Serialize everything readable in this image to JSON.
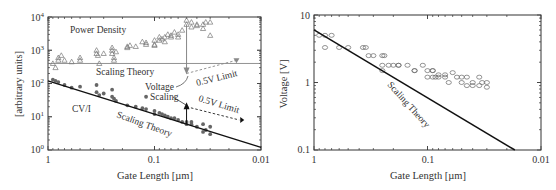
{
  "chart_data": [
    {
      "type": "scatter",
      "title": "",
      "xlabel": "Gate Length [µm]",
      "ylabel": "[arbitrary units]",
      "xscale": "log",
      "yscale": "log",
      "xlim": [
        1,
        0.01
      ],
      "ylim": [
        1,
        10000
      ],
      "x_tick_labels": [
        "1",
        "0.1",
        "0.01"
      ],
      "y_tick_labels": [
        {
          "base": "10",
          "exp": "0"
        },
        {
          "base": "10",
          "exp": "1"
        },
        {
          "base": "10",
          "exp": "2"
        },
        {
          "base": "10",
          "exp": "3"
        },
        {
          "base": "10",
          "exp": "4"
        }
      ],
      "grid": false,
      "annotations": {
        "power_density": "Power Density",
        "scaling_theory_upper": "Scaling Theory",
        "limit_upper": "0.5V Limit",
        "voltage_scaling_1": "Voltage",
        "voltage_scaling_2": "Scaling",
        "limit_lower": "0.5V Limit",
        "cvi": "CV/I",
        "scaling_theory_lower": "Scaling Theory"
      },
      "series": [
        {
          "name": "Power Density",
          "marker": "open-triangle",
          "x": [
            0.9,
            0.85,
            0.8,
            0.8,
            0.75,
            0.7,
            0.6,
            0.5,
            0.5,
            0.35,
            0.35,
            0.34,
            0.33,
            0.3,
            0.25,
            0.25,
            0.25,
            0.24,
            0.24,
            0.23,
            0.18,
            0.18,
            0.17,
            0.15,
            0.13,
            0.12,
            0.12,
            0.1,
            0.1,
            0.1,
            0.09,
            0.09,
            0.085,
            0.08,
            0.08,
            0.075,
            0.07,
            0.07,
            0.065,
            0.06,
            0.06,
            0.055,
            0.05,
            0.05,
            0.045,
            0.045,
            0.04,
            0.04,
            0.035,
            0.035,
            0.033,
            0.03,
            0.03
          ],
          "y": [
            400,
            300,
            600,
            500,
            700,
            500,
            450,
            600,
            500,
            1000,
            800,
            700,
            400,
            800,
            1200,
            1000,
            800,
            600,
            500,
            900,
            1300,
            1200,
            1400,
            1300,
            1800,
            1700,
            1500,
            2000,
            1500,
            1400,
            2500,
            2000,
            2200,
            2500,
            1800,
            3000,
            2800,
            2500,
            3500,
            3000,
            2500,
            4000,
            8000,
            6000,
            5000,
            7000,
            6000,
            5500,
            6000,
            4500,
            7000,
            7000,
            2800
          ]
        },
        {
          "name": "CV/I",
          "marker": "filled-circle",
          "x": [
            0.9,
            0.85,
            0.8,
            0.7,
            0.6,
            0.5,
            0.35,
            0.35,
            0.33,
            0.3,
            0.25,
            0.25,
            0.24,
            0.23,
            0.18,
            0.15,
            0.13,
            0.12,
            0.12,
            0.1,
            0.1,
            0.09,
            0.085,
            0.08,
            0.075,
            0.07,
            0.065,
            0.06,
            0.055,
            0.05,
            0.05,
            0.045,
            0.045,
            0.04,
            0.035,
            0.035,
            0.033,
            0.03,
            0.03
          ],
          "y": [
            130,
            120,
            110,
            90,
            75,
            80,
            90,
            55,
            45,
            50,
            65,
            40,
            35,
            30,
            22,
            20,
            18,
            17,
            40,
            15,
            12,
            13,
            12,
            11,
            10,
            9,
            9,
            8,
            7,
            7,
            6,
            6,
            7,
            5,
            6,
            3.5,
            4,
            5,
            3
          ]
        },
        {
          "name": "Scaling Theory (Power Density)",
          "type": "line",
          "x": [
            1,
            0.01
          ],
          "y": [
            400,
            400
          ]
        },
        {
          "name": "Scaling Theory (CV/I)",
          "type": "line",
          "x": [
            1,
            0.01
          ],
          "y": [
            120,
            1.2
          ]
        },
        {
          "name": "0.5V Limit (Power Density)",
          "type": "dashed-arrow",
          "x": [
            0.05,
            0.017
          ],
          "y": [
            200,
            500
          ]
        },
        {
          "name": "0.5V Limit (CV/I)",
          "type": "dashed-arrow",
          "x": [
            0.05,
            0.016
          ],
          "y": [
            20,
            8
          ]
        }
      ]
    },
    {
      "type": "scatter",
      "title": "",
      "xlabel": "Gate Length [µm]",
      "ylabel": "Voltage [V]",
      "xscale": "log",
      "yscale": "log",
      "xlim": [
        1,
        0.01
      ],
      "ylim": [
        0.1,
        10
      ],
      "x_tick_labels": [
        "1",
        "0.1",
        "0.01"
      ],
      "y_tick_labels": [
        "0.1",
        "1",
        "10"
      ],
      "grid": false,
      "annotations": {
        "scaling_theory": "Scaling Theory"
      },
      "series": [
        {
          "name": "Supply Voltage",
          "marker": "open-circle",
          "x": [
            0.9,
            0.8,
            0.7,
            0.8,
            0.6,
            0.5,
            0.37,
            0.35,
            0.33,
            0.3,
            0.25,
            0.25,
            0.22,
            0.25,
            0.24,
            0.2,
            0.18,
            0.18,
            0.15,
            0.13,
            0.13,
            0.11,
            0.1,
            0.1,
            0.09,
            0.09,
            0.09,
            0.085,
            0.08,
            0.08,
            0.07,
            0.07,
            0.065,
            0.06,
            0.055,
            0.05,
            0.05,
            0.045,
            0.045,
            0.04,
            0.04,
            0.035,
            0.035,
            0.033,
            0.03,
            0.03
          ],
          "y": [
            5,
            5,
            5,
            3.3,
            3.3,
            3.3,
            3.3,
            3.3,
            2.5,
            2.5,
            2.5,
            1.8,
            1.8,
            1.5,
            2.5,
            1.8,
            1.8,
            1.8,
            1.8,
            1.5,
            1.5,
            1.8,
            1.5,
            1.2,
            1.5,
            1.2,
            1.5,
            1.2,
            1.2,
            1.3,
            1.3,
            1.2,
            1.0,
            1.4,
            1.2,
            1.2,
            1.0,
            1.2,
            0.9,
            1.0,
            0.9,
            0.9,
            1.2,
            1.0,
            1.0,
            0.85
          ]
        },
        {
          "name": "Scaling Theory",
          "type": "line",
          "x": [
            1,
            0.017
          ],
          "y": [
            6,
            0.1
          ]
        }
      ]
    }
  ]
}
